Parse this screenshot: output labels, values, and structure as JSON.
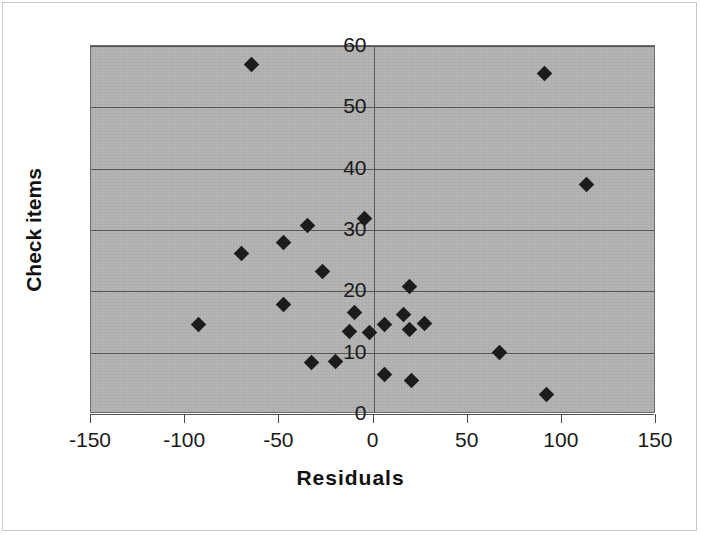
{
  "chart_data": {
    "type": "scatter",
    "title": "",
    "xlabel": "Residuals",
    "ylabel": "Check items",
    "xlim": [
      -150,
      150
    ],
    "ylim": [
      0,
      60
    ],
    "xticks": [
      "-150",
      "-100",
      "-50",
      "0",
      "50",
      "100",
      "150"
    ],
    "xtick_values": [
      -150,
      -100,
      -50,
      0,
      50,
      100,
      150
    ],
    "yticks": [
      "0",
      "10",
      "20",
      "30",
      "40",
      "50",
      "60"
    ],
    "ytick_values": [
      0,
      10,
      20,
      30,
      40,
      50,
      60
    ],
    "grid": "horizontal",
    "legend": "none",
    "y_axis_position": "x=0",
    "marker": "filled-diamond",
    "marker_color": "#1c1c1c",
    "plot_background": "#b0b0b0",
    "points": [
      {
        "x": -65,
        "y": 57.0
      },
      {
        "x": 91,
        "y": 55.5
      },
      {
        "x": 113,
        "y": 37.5
      },
      {
        "x": -5,
        "y": 31.8
      },
      {
        "x": -35,
        "y": 30.8
      },
      {
        "x": -48,
        "y": 28.0
      },
      {
        "x": -70,
        "y": 26.2
      },
      {
        "x": -27,
        "y": 23.2
      },
      {
        "x": 19,
        "y": 20.8
      },
      {
        "x": -48,
        "y": 17.8
      },
      {
        "x": -10,
        "y": 16.5
      },
      {
        "x": 16,
        "y": 16.3
      },
      {
        "x": 27,
        "y": 14.8
      },
      {
        "x": 6,
        "y": 14.6
      },
      {
        "x": -93,
        "y": 14.6
      },
      {
        "x": -13,
        "y": 13.5
      },
      {
        "x": -2,
        "y": 13.3
      },
      {
        "x": 19,
        "y": 13.8
      },
      {
        "x": 67,
        "y": 10.1
      },
      {
        "x": -33,
        "y": 8.4
      },
      {
        "x": -20,
        "y": 8.5
      },
      {
        "x": 6,
        "y": 6.5
      },
      {
        "x": 20,
        "y": 5.5
      },
      {
        "x": 92,
        "y": 3.2
      }
    ]
  }
}
